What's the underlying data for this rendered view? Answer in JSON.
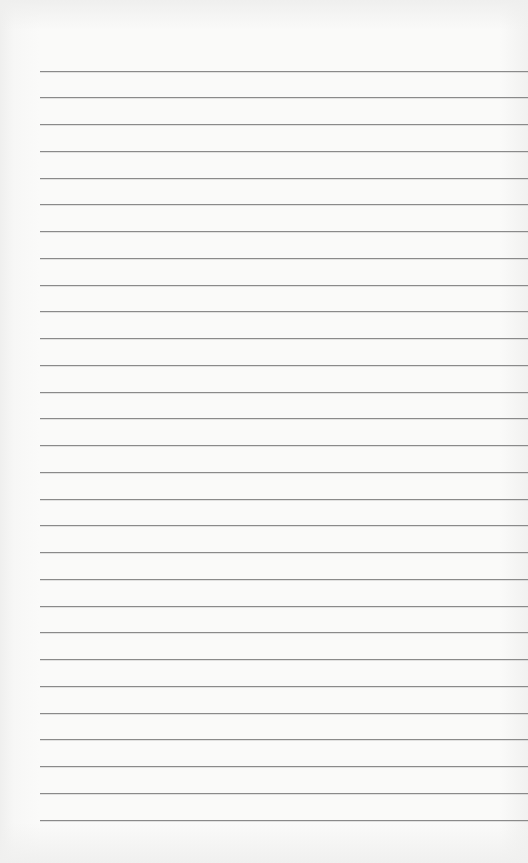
{
  "document": {
    "type": "blank-lined-paper",
    "ruled_lines": {
      "count": 29,
      "first_y": 70.5,
      "spacing": 26.75,
      "left_x": 40,
      "color": "#8a8a8a"
    },
    "background_color": "#fafaf9",
    "text": ""
  }
}
